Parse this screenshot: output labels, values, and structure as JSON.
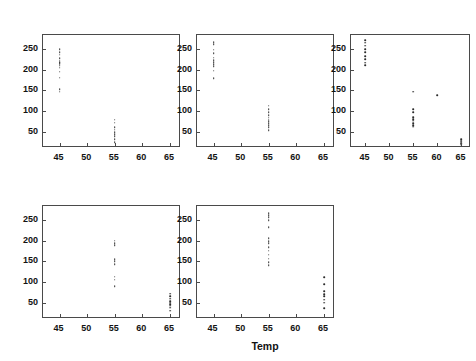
{
  "figure": {
    "panel_title_prefix": "Concentration = ",
    "x_axis_title": "Temp",
    "point_color": "#2b2b2b",
    "frame_color": "#4a4a4a",
    "background": "#ffffff"
  },
  "chart_data": {
    "type": "scatter",
    "title": "",
    "xlabel": "Temp",
    "ylabel": "",
    "xlim": [
      42,
      67
    ],
    "ylim": [
      10,
      285
    ],
    "xticks": [
      45,
      50,
      55,
      60,
      65
    ],
    "yticks": [
      50,
      100,
      150,
      200,
      250
    ],
    "grid": false,
    "legend": null,
    "facet_by": "Concentration",
    "facet_layout": [
      3,
      2
    ],
    "panels": [
      {
        "label": "Concentration = 15",
        "facet_value": 15,
        "x": [
          45,
          45,
          45,
          45,
          45,
          45,
          45,
          45,
          45,
          45,
          45,
          45,
          45,
          45,
          55,
          55,
          55,
          55,
          55,
          55,
          55,
          55,
          55
        ],
        "y": [
          250,
          243,
          237,
          228,
          222,
          219,
          216,
          213,
          210,
          205,
          196,
          181,
          153,
          147,
          79,
          72,
          61,
          55,
          49,
          44,
          38,
          31,
          24
        ]
      },
      {
        "label": "Concentration = 20",
        "facet_value": 20,
        "x": [
          45,
          45,
          45,
          45,
          45,
          45,
          45,
          45,
          45,
          45,
          45,
          55,
          55,
          55,
          55,
          55,
          55,
          55,
          55,
          55,
          55,
          55
        ],
        "y": [
          268,
          263,
          249,
          241,
          230,
          224,
          219,
          214,
          209,
          198,
          180,
          113,
          105,
          97,
          90,
          84,
          79,
          75,
          71,
          66,
          61,
          53
        ]
      },
      {
        "label": "Concentration = 25",
        "facet_value": 25,
        "x": [
          45,
          45,
          45,
          45,
          45,
          45,
          45,
          45,
          45,
          55,
          55,
          55,
          55,
          55,
          55,
          55,
          55,
          55,
          60,
          65,
          65,
          65,
          65,
          65
        ],
        "y": [
          272,
          266,
          259,
          251,
          243,
          234,
          226,
          218,
          211,
          147,
          104,
          97,
          85,
          80,
          76,
          71,
          66,
          62,
          139,
          32,
          28,
          25,
          22,
          18
        ]
      },
      {
        "label": "Concentration = 50",
        "facet_value": 50,
        "x": [
          55,
          55,
          55,
          55,
          55,
          55,
          55,
          55,
          55,
          65,
          65,
          65,
          65,
          65,
          65,
          65,
          65,
          65
        ],
        "y": [
          201,
          195,
          190,
          156,
          150,
          144,
          113,
          106,
          90,
          72,
          66,
          59,
          54,
          50,
          46,
          42,
          37,
          30
        ]
      },
      {
        "label": "Concentration = 75",
        "facet_value": 75,
        "x": [
          55,
          55,
          55,
          55,
          55,
          55,
          55,
          55,
          55,
          55,
          55,
          55,
          55,
          55,
          65,
          65,
          65,
          65,
          65,
          65,
          65,
          65
        ],
        "y": [
          268,
          263,
          258,
          251,
          233,
          206,
          200,
          194,
          185,
          176,
          166,
          157,
          148,
          141,
          112,
          94,
          77,
          71,
          66,
          57,
          50,
          36
        ]
      }
    ]
  }
}
